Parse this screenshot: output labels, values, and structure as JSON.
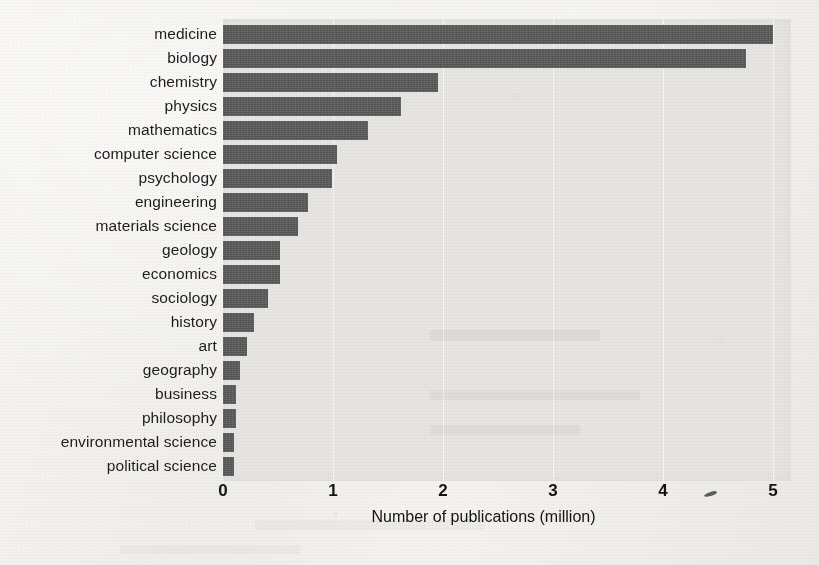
{
  "chart_data": {
    "type": "bar",
    "orientation": "horizontal",
    "title": "",
    "xlabel": "Number of publications (million)",
    "ylabel": "",
    "xlim": [
      0,
      5.25
    ],
    "xticks": [
      "0",
      "1",
      "2",
      "3",
      "4",
      "5"
    ],
    "xtick_values": [
      0,
      1,
      2,
      3,
      4,
      5
    ],
    "grid": "vertical gridlines at each x tick",
    "legend": "none",
    "bar_color": "#5b5b5b",
    "plot_background": "#e6e5e2",
    "figure_background": "#f1f0ec",
    "categories": [
      "medicine",
      "biology",
      "chemistry",
      "physics",
      "mathematics",
      "computer science",
      "psychology",
      "engineering",
      "materials science",
      "geology",
      "economics",
      "sociology",
      "history",
      "art",
      "geography",
      "business",
      "philosophy",
      "environmental science",
      "political science"
    ],
    "values": [
      5.0,
      4.75,
      1.95,
      1.62,
      1.32,
      1.04,
      0.99,
      0.77,
      0.68,
      0.52,
      0.52,
      0.41,
      0.28,
      0.22,
      0.15,
      0.12,
      0.12,
      0.1,
      0.1
    ],
    "units": "million publications"
  },
  "axis": {
    "x_title": "Number of publications (million)"
  }
}
